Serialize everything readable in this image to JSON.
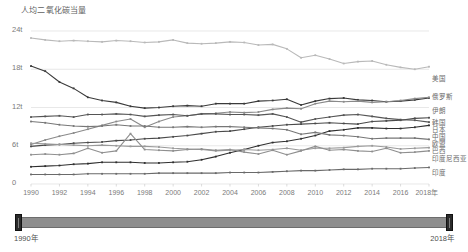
{
  "chart_data": {
    "type": "line",
    "title": "人均二氧化碳当量",
    "xlabel": "",
    "ylabel": "",
    "unit": "t",
    "grid": true,
    "legend_position": "right-end-of-line",
    "ylim": [
      0,
      24
    ],
    "xlim": [
      1990,
      2018
    ],
    "yticks": [
      0,
      6,
      12,
      18,
      24
    ],
    "ytick_labels": [
      "0",
      "6t",
      "12t",
      "18t",
      "24t"
    ],
    "x": [
      1990,
      1991,
      1992,
      1993,
      1994,
      1995,
      1996,
      1997,
      1998,
      1999,
      2000,
      2001,
      2002,
      2003,
      2004,
      2005,
      2006,
      2007,
      2008,
      2009,
      2010,
      2011,
      2012,
      2013,
      2014,
      2015,
      2016,
      2017,
      2018
    ],
    "xticks": [
      1990,
      1992,
      1994,
      1996,
      1998,
      2000,
      2002,
      2004,
      2006,
      2008,
      2010,
      2012,
      2014,
      2016,
      2018
    ],
    "xtick_labels": [
      "1990",
      "1992",
      "1994",
      "1996",
      "1998",
      "2000",
      "2002",
      "2004",
      "2006",
      "2008",
      "2010",
      "2012",
      "2014",
      "2016",
      "2018年"
    ],
    "series": [
      {
        "name": "美国",
        "color": "#b9b9b9",
        "values": [
          22.9,
          22.6,
          22.4,
          22.5,
          22.4,
          22.3,
          22.5,
          22.4,
          22.2,
          22.3,
          22.6,
          22.1,
          22.0,
          22.1,
          22.3,
          22.2,
          21.8,
          21.9,
          21.2,
          19.8,
          20.2,
          19.6,
          18.9,
          19.2,
          19.3,
          18.7,
          18.3,
          18.0,
          18.4
        ]
      },
      {
        "name": "俄罗斯",
        "color": "#3a3a3a",
        "values": [
          18.5,
          17.7,
          16.0,
          15.0,
          13.6,
          13.1,
          12.8,
          12.2,
          11.9,
          12.0,
          12.2,
          12.3,
          12.2,
          12.6,
          12.6,
          12.6,
          13.0,
          13.1,
          13.3,
          12.4,
          13.0,
          13.4,
          13.5,
          13.2,
          13.1,
          12.9,
          13.0,
          13.2,
          13.5
        ]
      },
      {
        "name": "伊朗",
        "color": "#4a4a4a",
        "values": [
          5.9,
          6.1,
          6.2,
          6.4,
          6.5,
          6.6,
          6.8,
          6.9,
          7.1,
          7.2,
          7.4,
          7.6,
          7.9,
          8.2,
          8.3,
          8.6,
          8.9,
          9.1,
          9.3,
          9.4,
          9.5,
          9.6,
          9.5,
          9.4,
          9.8,
          9.9,
          10.0,
          10.3,
          10.4
        ]
      },
      {
        "name": "韩国",
        "color": "#8a8a8a",
        "values": [
          6.2,
          6.9,
          7.5,
          8.0,
          8.6,
          9.2,
          9.8,
          10.2,
          8.9,
          9.8,
          10.5,
          10.7,
          11.0,
          11.1,
          11.3,
          11.2,
          11.3,
          11.7,
          11.9,
          11.8,
          12.6,
          13.0,
          12.9,
          13.0,
          12.8,
          12.9,
          13.1,
          13.4,
          13.6
        ]
      },
      {
        "name": "日本",
        "color": "#555555",
        "values": [
          10.5,
          10.6,
          10.7,
          10.5,
          10.9,
          10.9,
          11.0,
          10.9,
          10.6,
          10.8,
          10.9,
          10.7,
          11.0,
          11.0,
          10.9,
          10.9,
          10.8,
          11.0,
          10.5,
          9.7,
          10.2,
          10.5,
          10.8,
          10.9,
          10.6,
          10.3,
          10.1,
          10.0,
          9.7
        ]
      },
      {
        "name": "中国",
        "color": "#2f2f2f",
        "values": [
          2.7,
          2.8,
          2.9,
          3.1,
          3.2,
          3.4,
          3.4,
          3.4,
          3.3,
          3.3,
          3.4,
          3.5,
          3.8,
          4.3,
          4.9,
          5.4,
          6.0,
          6.5,
          6.7,
          7.1,
          7.6,
          8.3,
          8.5,
          8.8,
          8.8,
          8.7,
          8.7,
          8.9,
          9.2
        ]
      },
      {
        "name": "欧盟",
        "color": "#777777",
        "values": [
          9.8,
          9.6,
          9.3,
          9.1,
          9.0,
          9.1,
          9.3,
          9.1,
          9.1,
          8.9,
          8.9,
          9.0,
          8.9,
          9.0,
          9.0,
          8.9,
          8.8,
          8.7,
          8.5,
          7.8,
          8.1,
          7.7,
          7.6,
          7.4,
          7.1,
          7.2,
          7.2,
          7.2,
          7.0
        ]
      },
      {
        "name": "巴西",
        "color": "#9a9a9a",
        "values": [
          6.4,
          6.3,
          6.2,
          6.1,
          6.0,
          6.1,
          6.0,
          5.9,
          5.9,
          5.8,
          5.6,
          5.5,
          5.4,
          5.2,
          5.3,
          5.4,
          5.3,
          5.4,
          5.6,
          5.3,
          5.6,
          5.6,
          5.7,
          5.9,
          6.0,
          5.8,
          5.5,
          5.6,
          5.7
        ]
      },
      {
        "name": "印度尼西亚",
        "color": "#8f8f8f",
        "values": [
          4.6,
          4.7,
          4.6,
          4.8,
          5.6,
          4.9,
          5.2,
          7.9,
          5.4,
          5.3,
          5.2,
          5.4,
          5.5,
          5.3,
          5.4,
          5.0,
          4.7,
          5.3,
          4.6,
          5.2,
          5.9,
          5.3,
          5.4,
          5.2,
          5.1,
          5.6,
          4.9,
          5.0,
          5.2
        ]
      },
      {
        "name": "印度",
        "color": "#6a6a6a",
        "values": [
          1.5,
          1.5,
          1.5,
          1.5,
          1.6,
          1.6,
          1.6,
          1.6,
          1.6,
          1.7,
          1.7,
          1.7,
          1.7,
          1.7,
          1.8,
          1.8,
          1.8,
          1.9,
          2.0,
          2.1,
          2.1,
          2.2,
          2.3,
          2.3,
          2.4,
          2.4,
          2.4,
          2.5,
          2.6
        ]
      }
    ],
    "series_labels": [
      {
        "name": "美国",
        "y_px": 78
      },
      {
        "name": "俄罗斯",
        "y_px": 96
      },
      {
        "name": "伊朗",
        "y_px": 110
      },
      {
        "name": "韩国",
        "y_px": 122
      },
      {
        "name": "日本",
        "y_px": 129
      },
      {
        "name": "中国",
        "y_px": 136
      },
      {
        "name": "欧盟",
        "y_px": 143
      },
      {
        "name": "巴西",
        "y_px": 150
      },
      {
        "name": "印度尼西亚",
        "y_px": 158
      },
      {
        "name": "印度",
        "y_px": 172
      }
    ]
  },
  "slider": {
    "start_label": "1990年",
    "end_label": "2018年"
  }
}
